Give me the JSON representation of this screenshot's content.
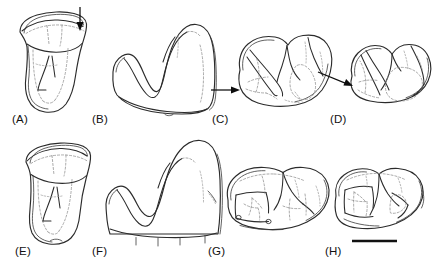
{
  "figure": {
    "kind": "scientific-line-drawing-plate",
    "background_color": "#ffffff",
    "ink_color": "#2b2b2b",
    "dashed_color": "#8d8d8d",
    "arrow_color": "#0d0d0d",
    "rows": 2,
    "columns": 4
  },
  "panels": [
    {
      "id": "A",
      "label": "(A)",
      "label_x": 12,
      "label_y": 123,
      "view": "lingual / side view of upper tooth crown and root",
      "has_arrow": true,
      "arrow": {
        "direction": "down",
        "tip_x": 80,
        "tip_y": 29,
        "tail_x": 80,
        "tail_y": 7
      }
    },
    {
      "id": "B",
      "label": "(B)",
      "label_x": 92,
      "label_y": 123,
      "view": "buccal / lateral view of tooth crown with two cusps",
      "has_arrow": false
    },
    {
      "id": "C",
      "label": "(C)",
      "label_x": 212,
      "label_y": 123,
      "view": "occlusal view of upper molar showing crests and basins",
      "has_arrow": true,
      "arrow": {
        "direction": "right",
        "tip_x": 240,
        "tip_y": 90,
        "tail_x": 211,
        "tail_y": 90
      }
    },
    {
      "id": "D",
      "label": "(D)",
      "label_x": 330,
      "label_y": 123,
      "view": "occlusal view of second molar, oblique, showing trigon basin",
      "has_arrow": true,
      "arrow": {
        "direction": "down-right",
        "tip_x": 353,
        "tip_y": 86,
        "tail_x": 318,
        "tail_y": 72
      }
    },
    {
      "id": "E",
      "label": "(E)",
      "label_x": 15,
      "label_y": 255,
      "view": "lingual / side view of upper tooth crown and root",
      "has_arrow": false
    },
    {
      "id": "F",
      "label": "(F)",
      "label_x": 92,
      "label_y": 255,
      "view": "buccal / lateral view of tooth crown with root stubs",
      "has_arrow": false
    },
    {
      "id": "G",
      "label": "(G)",
      "label_x": 208,
      "label_y": 255,
      "view": "occlusal view of molar with enamel outlines and fossae",
      "has_arrow": false
    },
    {
      "id": "H",
      "label": "(H)",
      "label_x": 325,
      "label_y": 255,
      "view": "occlusal view of worn molar with dentine islands",
      "has_arrow": false
    }
  ],
  "scale_bar": {
    "present": true,
    "label": "",
    "x1": 352,
    "x2": 397,
    "y": 241,
    "color": "#111111",
    "thickness_px": 2.3
  }
}
